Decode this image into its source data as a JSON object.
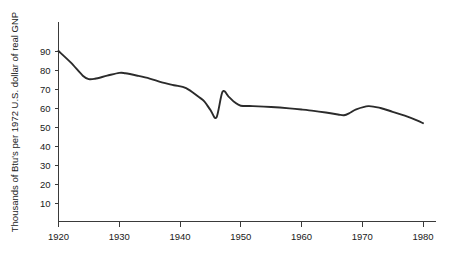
{
  "chart_data": {
    "type": "line",
    "title": "",
    "subtitle": "",
    "xlabel": "",
    "ylabel": "Thousands of Btu's per 1972 U.S. dollar of real GNP",
    "xlim": [
      1920,
      1980
    ],
    "ylim": [
      0,
      95
    ],
    "grid": false,
    "legend": false,
    "legend_position": "none",
    "x_ticks": [
      1920,
      1930,
      1940,
      1950,
      1960,
      1970,
      1980
    ],
    "x_tick_labels": [
      "1920",
      "1930",
      "1940",
      "1950",
      "1960",
      "1970",
      "1980"
    ],
    "y_ticks": [
      10,
      20,
      30,
      40,
      50,
      60,
      70,
      80,
      90
    ],
    "y_tick_labels": [
      "10",
      "20",
      "30",
      "40",
      "50",
      "60",
      "70",
      "80",
      "90"
    ],
    "line_color": "#2b2b2b",
    "axis_color": "#3a3a3a",
    "series": [
      {
        "name": "Energy intensity",
        "x": [
          1920,
          1922,
          1924,
          1925,
          1926,
          1928,
          1930,
          1931,
          1933,
          1935,
          1937,
          1939,
          1941,
          1943,
          1944,
          1945,
          1946,
          1947,
          1948,
          1949,
          1950,
          1952,
          1955,
          1958,
          1960,
          1962,
          1964,
          1966,
          1967,
          1968,
          1969,
          1971,
          1973,
          1975,
          1977,
          1979,
          1980
        ],
        "values": [
          90,
          84,
          77,
          75.2,
          75.4,
          77,
          78.5,
          78.3,
          77,
          75.5,
          73.5,
          72,
          70.5,
          66,
          63.5,
          59,
          55,
          68.5,
          66,
          63,
          61.2,
          61,
          60.5,
          59.8,
          59.2,
          58.5,
          57.6,
          56.6,
          56.2,
          57.5,
          59.3,
          61,
          60,
          58,
          56,
          53.5,
          52
        ]
      }
    ]
  }
}
